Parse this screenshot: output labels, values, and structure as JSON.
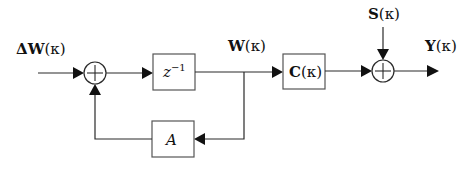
{
  "diagram": {
    "type": "block-diagram",
    "signals": {
      "input": {
        "main": "ΔW",
        "arg": "(κ)"
      },
      "state": {
        "main": "W",
        "arg": "(κ)"
      },
      "noise": {
        "main": "S",
        "arg": "(κ)"
      },
      "output": {
        "main": "Y",
        "arg": "(κ)"
      }
    },
    "blocks": {
      "delay": {
        "base": "z",
        "exp": "−1"
      },
      "feedback": {
        "label": "A"
      },
      "observation": {
        "main": "C",
        "arg": "(κ)"
      }
    },
    "summing_junctions": [
      {
        "id": "sum-1",
        "symbol": "+"
      },
      {
        "id": "sum-2",
        "symbol": "+"
      }
    ],
    "colors": {
      "line": "#2a2a2a",
      "box_border": "#555555",
      "background": "#ffffff"
    }
  }
}
